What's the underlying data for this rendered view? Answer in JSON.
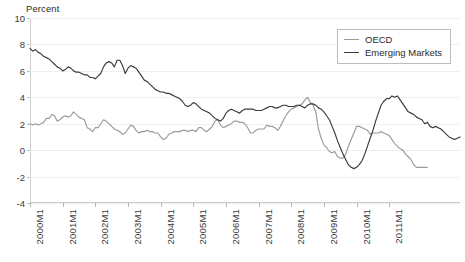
{
  "chart_data": {
    "type": "line",
    "title": "",
    "ylabel": "Percent",
    "xlabel": "",
    "ylim": [
      -4,
      10
    ],
    "yticks": [
      10,
      8,
      6,
      4,
      2,
      0,
      -2,
      -4
    ],
    "grid": true,
    "legend_position": "top-right",
    "x_tick_labels": [
      "2000M1",
      "2001M1",
      "2002M1",
      "2003M1",
      "2004M1",
      "2005M1",
      "2006M1",
      "2007M1",
      "2008M1",
      "2009M1",
      "2010M1",
      "2011M1"
    ],
    "x_range": [
      "2000M1",
      "2011M11"
    ],
    "series": [
      {
        "name": "OECD",
        "color": "#9a9a9a",
        "values": [
          2.0,
          1.9,
          2.0,
          1.9,
          2.0,
          2.1,
          2.4,
          2.4,
          2.7,
          2.6,
          2.2,
          2.3,
          2.5,
          2.6,
          2.5,
          2.6,
          2.9,
          2.7,
          2.5,
          2.4,
          2.3,
          1.7,
          1.6,
          1.4,
          1.7,
          1.7,
          2.0,
          2.3,
          2.2,
          2.0,
          1.8,
          1.6,
          1.5,
          1.4,
          1.2,
          1.3,
          1.6,
          1.9,
          1.8,
          1.5,
          1.3,
          1.4,
          1.4,
          1.5,
          1.4,
          1.4,
          1.3,
          1.3,
          1.0,
          0.8,
          0.9,
          1.2,
          1.3,
          1.4,
          1.4,
          1.4,
          1.5,
          1.5,
          1.4,
          1.5,
          1.5,
          1.4,
          1.7,
          1.7,
          1.5,
          1.4,
          1.6,
          1.8,
          2.2,
          2.3,
          1.9,
          1.7,
          1.8,
          1.9,
          2.0,
          2.2,
          2.2,
          2.1,
          2.1,
          2.0,
          1.7,
          1.3,
          1.3,
          1.5,
          1.6,
          1.6,
          1.6,
          1.9,
          1.8,
          1.8,
          1.7,
          1.5,
          1.8,
          2.2,
          2.6,
          2.9,
          3.1,
          3.2,
          3.3,
          3.4,
          3.5,
          3.8,
          4.0,
          3.6,
          3.4,
          2.9,
          1.6,
          0.9,
          0.4,
          0.2,
          -0.1,
          -0.2,
          -0.1,
          -0.5,
          -0.6,
          -0.6,
          -0.3,
          0.3,
          0.8,
          1.3,
          1.8,
          1.8,
          1.7,
          1.6,
          1.5,
          1.2,
          1.3,
          1.3,
          1.3,
          1.4,
          1.3,
          1.2,
          1.1,
          0.8,
          0.5,
          0.3,
          0.1,
          0.0,
          -0.3,
          -0.5,
          -0.7,
          -1.1,
          -1.3,
          -1.3,
          -1.3,
          -1.3,
          -1.3
        ]
      },
      {
        "name": "Emerging Markets",
        "color": "#3a3a3a",
        "values": [
          7.7,
          7.5,
          7.6,
          7.4,
          7.3,
          7.1,
          7.0,
          6.9,
          6.7,
          6.5,
          6.3,
          6.2,
          6.0,
          6.1,
          6.3,
          6.2,
          6.0,
          5.9,
          5.9,
          5.8,
          5.7,
          5.7,
          5.5,
          5.5,
          5.4,
          5.6,
          5.8,
          6.3,
          6.6,
          6.7,
          6.6,
          6.3,
          6.8,
          6.8,
          6.4,
          5.8,
          6.2,
          6.4,
          6.3,
          6.2,
          5.9,
          5.6,
          5.3,
          5.2,
          5.0,
          4.8,
          4.6,
          4.5,
          4.4,
          4.4,
          4.3,
          4.3,
          4.2,
          4.1,
          4.0,
          3.9,
          3.7,
          3.4,
          3.3,
          3.4,
          3.6,
          3.5,
          3.3,
          3.1,
          3.0,
          2.9,
          2.8,
          2.6,
          2.4,
          2.3,
          2.2,
          2.4,
          2.8,
          3.0,
          3.1,
          3.0,
          2.9,
          2.8,
          3.0,
          3.1,
          3.1,
          3.1,
          3.1,
          3.0,
          3.0,
          3.0,
          3.1,
          3.2,
          3.3,
          3.3,
          3.2,
          3.2,
          3.3,
          3.4,
          3.4,
          3.3,
          3.3,
          3.3,
          3.4,
          3.4,
          3.3,
          3.2,
          3.4,
          3.5,
          3.5,
          3.4,
          3.2,
          3.1,
          2.9,
          2.6,
          2.3,
          1.8,
          1.3,
          0.7,
          0.2,
          -0.3,
          -0.7,
          -1.1,
          -1.3,
          -1.4,
          -1.3,
          -1.1,
          -0.8,
          -0.3,
          0.3,
          0.9,
          1.5,
          2.2,
          2.8,
          3.4,
          3.7,
          3.9,
          3.9,
          4.1,
          4.0,
          4.1,
          3.8,
          3.5,
          3.2,
          2.9,
          2.8,
          2.7,
          2.5,
          2.4,
          2.3,
          2.0,
          2.1,
          1.8,
          1.7,
          1.8,
          1.7,
          1.6,
          1.4,
          1.2,
          1.0,
          0.9,
          0.8,
          0.9,
          1.0
        ]
      }
    ]
  },
  "legend": {
    "items": [
      {
        "label": "OECD"
      },
      {
        "label": "Emerging Markets"
      }
    ]
  }
}
